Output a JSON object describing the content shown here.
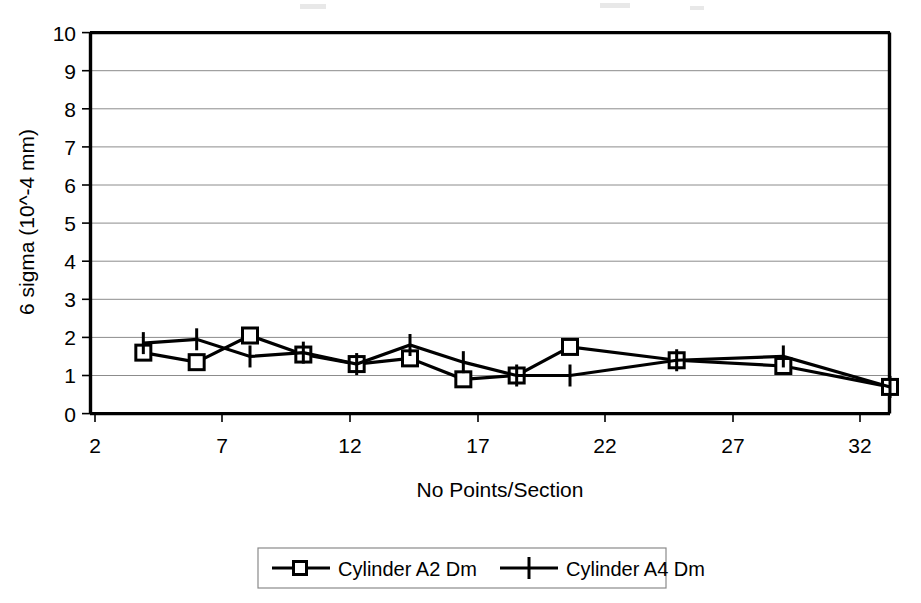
{
  "chart_data": {
    "type": "line",
    "title": "",
    "xlabel": "No Points/Section",
    "ylabel": "6 sigma (10^-4 mm)",
    "xlim": [
      2,
      32
    ],
    "ylim": [
      0,
      10
    ],
    "grid": true,
    "legend_position": "bottom",
    "xticks": [
      "2",
      "7",
      "12",
      "17",
      "22",
      "27",
      "32"
    ],
    "xtick_values": [
      2,
      7,
      12,
      17,
      22,
      27,
      32
    ],
    "yticks": [
      "0",
      "1",
      "2",
      "3",
      "4",
      "5",
      "6",
      "7",
      "8",
      "9",
      "10"
    ],
    "ytick_values": [
      0,
      1,
      2,
      3,
      4,
      5,
      6,
      7,
      8,
      9,
      10
    ],
    "x": [
      4,
      6,
      8,
      10,
      12,
      14,
      16,
      18,
      20,
      24,
      28,
      32
    ],
    "series": [
      {
        "name": "Cylinder A2 Dm",
        "marker": "square",
        "values": [
          1.6,
          1.35,
          2.05,
          1.55,
          1.3,
          1.45,
          0.9,
          1.0,
          1.75,
          1.4,
          1.25,
          0.7
        ]
      },
      {
        "name": "Cylinder A4 Dm",
        "marker": "plus",
        "values": [
          1.85,
          1.95,
          1.5,
          1.6,
          1.3,
          1.8,
          1.35,
          1.0,
          1.0,
          1.4,
          1.5,
          0.7
        ]
      }
    ]
  },
  "legend": {
    "items": [
      {
        "label": "Cylinder A2 Dm",
        "marker": "square-marker"
      },
      {
        "label": "Cylinder A4 Dm",
        "marker": "plus-marker"
      }
    ]
  },
  "axes": {
    "y_title": "6 sigma (10^-4 mm)",
    "x_title": "No Points/Section",
    "y_tick_labels": [
      "10",
      "9",
      "8",
      "7",
      "6",
      "5",
      "4",
      "3",
      "2",
      "1",
      "0"
    ],
    "x_tick_labels": [
      "2",
      "7",
      "12",
      "17",
      "22",
      "27",
      "32"
    ]
  },
  "colors": {
    "ink": "#000000",
    "grid": "#8c8c8c",
    "background": "#ffffff"
  }
}
